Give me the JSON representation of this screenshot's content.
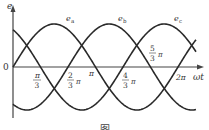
{
  "figure": {
    "axis": {
      "y_label": "e",
      "x_label": "ωt",
      "origin_label": "0"
    },
    "tick_labels": [
      {
        "id": "pi_3",
        "num": "π",
        "den": "3",
        "suffix": ""
      },
      {
        "id": "2pi_3",
        "num": "2",
        "den": "3",
        "suffix": "π"
      },
      {
        "id": "pi",
        "text": "π"
      },
      {
        "id": "4pi_3",
        "num": "4",
        "den": "3",
        "suffix": "π"
      },
      {
        "id": "5pi_3",
        "num": "5",
        "den": "3",
        "suffix": "π"
      },
      {
        "id": "2pi",
        "text": "2π"
      }
    ],
    "curve_labels": {
      "ea": "e",
      "ea_sub": "a",
      "eb": "e",
      "eb_sub": "b",
      "ec": "e",
      "ec_sub": "c"
    },
    "caption": "图"
  },
  "chart_data": {
    "type": "line",
    "xlabel": "ωt",
    "ylabel": "e",
    "x_ticks": [
      "π/3",
      "2π/3",
      "π",
      "4π/3",
      "5π/3",
      "2π"
    ],
    "series": [
      {
        "name": "e_a",
        "formula": "Em·sin(ωt)",
        "phase_deg": 0
      },
      {
        "name": "e_b",
        "formula": "Em·sin(ωt − 120°)",
        "phase_deg": -120
      },
      {
        "name": "e_c",
        "formula": "Em·sin(ωt + 120°)",
        "phase_deg": 120
      }
    ],
    "xlim": [
      "0",
      "2π"
    ],
    "grid": false
  }
}
